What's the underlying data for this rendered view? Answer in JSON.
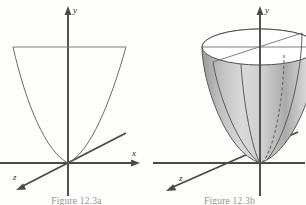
{
  "sheet": {
    "background_color": "#fdfdfc",
    "ink_color": "#4a4a4a",
    "curve_color": "#6b6b6b",
    "surface_fill_color": "#b9b9b9"
  },
  "figures": [
    {
      "id": "figure-a",
      "caption": "Figure 12.3a",
      "description": "Parabola y = x squared in the xy-plane with a horizontal chord, drawn on 3D axes",
      "axes": [
        {
          "name": "y-axis",
          "label": "y",
          "direction": "up"
        },
        {
          "name": "x-axis",
          "label": "x",
          "direction": "right"
        },
        {
          "name": "z-axis",
          "label": "z",
          "direction": "down-left"
        }
      ],
      "origin": {
        "x": 68,
        "y": 163
      },
      "curve": {
        "type": "parabola",
        "equation": "y = x^2",
        "opens": "up",
        "vertex": {
          "x": 68,
          "y": 163
        }
      },
      "chord": {
        "type": "horizontal-line",
        "from": {
          "x": 13,
          "y": 47
        },
        "to": {
          "x": 126,
          "y": 47
        }
      }
    },
    {
      "id": "figure-b",
      "caption": "Figure 12.3b",
      "description": "Circular paraboloid z = x squared plus y squared shown as a shaded solid of revolution with elliptical top rim",
      "axes": [
        {
          "name": "y-axis",
          "label": "y",
          "direction": "up"
        },
        {
          "name": "x-axis",
          "label": "x",
          "direction": "right"
        },
        {
          "name": "z-axis",
          "label": "z",
          "direction": "down-left"
        }
      ],
      "origin": {
        "x": 107,
        "y": 163
      },
      "surface": {
        "type": "paraboloid",
        "shading": "gray-gradient",
        "rim": {
          "type": "ellipse",
          "cx": 107,
          "cy": 47,
          "rx": 58,
          "ry": 18
        },
        "ribs_solid": 3,
        "ribs_dashed": 1
      }
    }
  ],
  "axis_labels": {
    "x": "x",
    "y": "y",
    "z": "z"
  }
}
